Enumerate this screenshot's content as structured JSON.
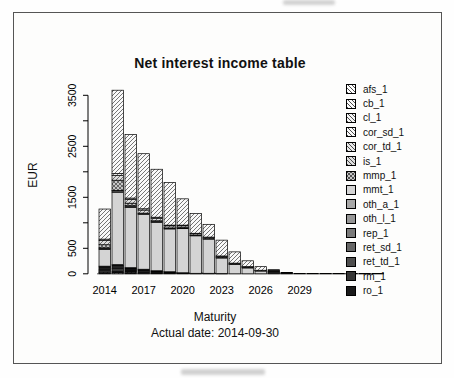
{
  "chart_data": {
    "type": "bar",
    "stacked": true,
    "title": "Net interest income table",
    "ylabel": "EUR",
    "xlabel": "Maturity",
    "caption": "Actual date: 2014-09-30",
    "ylim": [
      0,
      3700
    ],
    "grid": false,
    "legend_position": "right",
    "y_ticks": [
      {
        "value": 0,
        "label": "0"
      },
      {
        "value": 500,
        "label": "500"
      },
      {
        "value": 1000,
        "label": ""
      },
      {
        "value": 1500,
        "label": "1500"
      },
      {
        "value": 2000,
        "label": ""
      },
      {
        "value": 2500,
        "label": "2500"
      },
      {
        "value": 3000,
        "label": ""
      },
      {
        "value": 3500,
        "label": "3500"
      }
    ],
    "categories": [
      "2014",
      "2015",
      "2016",
      "2017",
      "2018",
      "2019",
      "2020",
      "2021",
      "2022",
      "2023",
      "2024",
      "2025",
      "2026",
      "2027",
      "2028",
      "2029",
      "2030",
      "2031",
      "2032",
      "2033",
      "2034",
      "2035"
    ],
    "x_tick_labels": [
      {
        "index": 0,
        "label": "2014"
      },
      {
        "index": 3,
        "label": "2017"
      },
      {
        "index": 6,
        "label": "2020"
      },
      {
        "index": 9,
        "label": "2023"
      },
      {
        "index": 12,
        "label": "2026"
      },
      {
        "index": 15,
        "label": "2029"
      }
    ],
    "stack_order": [
      "afs_1",
      "cb_1",
      "cl_1",
      "rep_1",
      "ret_sd_1",
      "ret_td_1",
      "rm_1",
      "ro_1",
      "mmt_1",
      "oth_a_1",
      "oth_l_1",
      "mmp_1",
      "is_1",
      "cor_td_1",
      "cor_sd_1"
    ],
    "series": [
      {
        "name": "afs_1",
        "fill": "#ffffff",
        "pattern": "hatch",
        "values": [
          15,
          20,
          15,
          0,
          0,
          0,
          0,
          0,
          0,
          0,
          0,
          0,
          0,
          0,
          0,
          0,
          0,
          0,
          0,
          0,
          0,
          0
        ]
      },
      {
        "name": "cb_1",
        "fill": "#fbfbfb",
        "pattern": "hatch",
        "values": [
          10,
          15,
          10,
          0,
          0,
          0,
          0,
          0,
          0,
          0,
          0,
          0,
          0,
          0,
          0,
          0,
          0,
          0,
          0,
          0,
          0,
          0
        ]
      },
      {
        "name": "cl_1",
        "fill": "#f4f4f4",
        "pattern": "hatch",
        "values": [
          15,
          15,
          15,
          0,
          0,
          0,
          0,
          0,
          0,
          0,
          0,
          0,
          0,
          0,
          0,
          0,
          0,
          0,
          0,
          0,
          0,
          0
        ]
      },
      {
        "name": "cor_sd_1",
        "fill": "#f9f9f9",
        "pattern": "hatch",
        "values": [
          590,
          1635,
          1245,
          1080,
          940,
          835,
          515,
          385,
          250,
          310,
          220,
          115,
          70,
          0,
          0,
          0,
          0,
          0,
          0,
          0,
          0,
          0
        ]
      },
      {
        "name": "cor_td_1",
        "fill": "#e8e8e8",
        "pattern": "hatch",
        "values": [
          30,
          40,
          30,
          25,
          20,
          15,
          15,
          10,
          10,
          10,
          5,
          5,
          5,
          0,
          0,
          0,
          0,
          0,
          0,
          0,
          0,
          0
        ]
      },
      {
        "name": "is_1",
        "fill": "#dedede",
        "pattern": "hatch",
        "values": [
          80,
          90,
          70,
          60,
          50,
          40,
          35,
          25,
          20,
          20,
          15,
          10,
          5,
          0,
          0,
          0,
          0,
          0,
          0,
          0,
          0,
          0
        ]
      },
      {
        "name": "mmp_1",
        "fill": "#c6c6c6",
        "pattern": "crosshatch",
        "values": [
          60,
          200,
          50,
          0,
          0,
          0,
          0,
          0,
          0,
          0,
          0,
          0,
          0,
          0,
          0,
          0,
          0,
          0,
          0,
          0,
          0,
          0
        ]
      },
      {
        "name": "mmt_1",
        "fill": "#d4d4d4",
        "pattern": "solid",
        "values": [
          330,
          1420,
          1180,
          1070,
          950,
          840,
          865,
          735,
          670,
          305,
          180,
          115,
          55,
          0,
          0,
          4,
          3,
          2,
          2,
          1,
          0.5,
          0.5
        ]
      },
      {
        "name": "oth_a_1",
        "fill": "#a8a8a8",
        "pattern": "solid",
        "values": [
          20,
          25,
          25,
          20,
          20,
          15,
          15,
          10,
          10,
          10,
          10,
          10,
          5,
          0,
          0,
          0,
          0,
          0,
          0,
          0,
          0,
          0
        ]
      },
      {
        "name": "oth_l_1",
        "fill": "#969696",
        "pattern": "solid",
        "values": [
          10,
          10,
          10,
          10,
          10,
          5,
          5,
          5,
          0,
          0,
          0,
          0,
          0,
          0,
          0,
          0,
          0,
          0,
          0,
          0,
          0,
          0
        ]
      },
      {
        "name": "rep_1",
        "fill": "#7a7a7a",
        "pattern": "solid",
        "values": [
          22,
          26,
          16,
          18,
          12,
          8,
          4,
          2,
          2,
          1,
          0,
          0,
          0,
          0,
          10,
          0,
          0,
          0,
          0,
          0,
          0,
          0
        ]
      },
      {
        "name": "ret_sd_1",
        "fill": "#666666",
        "pattern": "solid",
        "values": [
          22,
          26,
          16,
          18,
          12,
          8,
          4,
          2,
          2,
          1,
          0,
          0,
          0,
          0,
          8,
          0,
          0,
          0,
          0,
          0,
          0,
          0
        ]
      },
      {
        "name": "ret_td_1",
        "fill": "#4e4e4e",
        "pattern": "solid",
        "values": [
          28,
          32,
          20,
          23,
          15,
          10,
          5,
          3,
          2,
          1,
          0,
          0,
          0,
          20,
          8,
          0,
          0,
          0,
          0,
          0,
          0,
          0
        ]
      },
      {
        "name": "rm_1",
        "fill": "#363636",
        "pattern": "solid",
        "values": [
          22,
          26,
          16,
          18,
          12,
          8,
          4,
          2,
          2,
          1,
          0,
          0,
          0,
          25,
          0,
          0,
          0,
          0,
          0,
          0,
          0,
          0
        ]
      },
      {
        "name": "ro_1",
        "fill": "#1a1a1a",
        "pattern": "solid",
        "values": [
          16,
          20,
          12,
          13,
          9,
          6,
          3,
          1,
          2,
          1,
          0,
          0,
          0,
          35,
          0,
          0,
          0,
          0,
          0,
          0,
          0,
          0
        ]
      }
    ]
  }
}
